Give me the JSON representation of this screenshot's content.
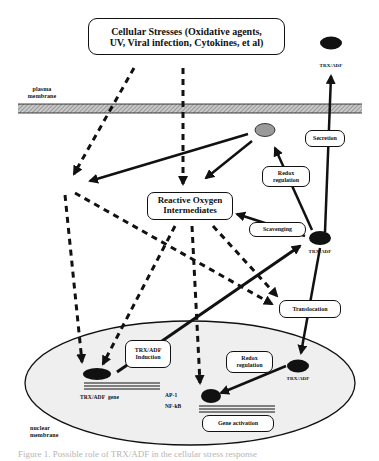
{
  "figure": {
    "type": "biological pathway diagram",
    "colors": {
      "ink": "#111111",
      "membrane_fill": "#b8b8b8",
      "nucleus_fill": "#efefef",
      "grey_molecule": "#9a9a9a",
      "caption_text": "#b5b5b5"
    }
  },
  "boxes": {
    "cellular_stresses": {
      "line1": "Cellular Stresses (Oxidative agents,",
      "line2": "UV, Viral infection, Cytokines, et al)"
    },
    "reactive_oxygen": {
      "line1": "Reactive Oxygen",
      "line2": "Intermediates"
    },
    "secretion": "Secretion",
    "redox_upper": {
      "line1": "Redox",
      "line2": "regulation"
    },
    "scavenging": "Scavenging",
    "translocation": "Translocation",
    "trx_induction": {
      "line1": "TRX/ADF",
      "line2": "Induction"
    },
    "redox_lower": {
      "line1": "Redox",
      "line2": "regulation"
    },
    "gene_activation": "Gene activation"
  },
  "labels": {
    "plasma_membrane": {
      "line1": "plasma",
      "line2": "membrane"
    },
    "nuclear_membrane": {
      "line1": "nuclear",
      "line2": "membrane"
    },
    "trx_extracellular": "TRX/ADF",
    "trx_cytoplasm": "TRX/ADF",
    "trx_nuclear": "TRX/ADF",
    "trx_gene": "TRX/ADF  gene",
    "ap1": "AP-1",
    "nfkb": "NF-kB"
  },
  "caption": "Figure 1.  Possible role of TRX/ADF in the cellular stress response"
}
